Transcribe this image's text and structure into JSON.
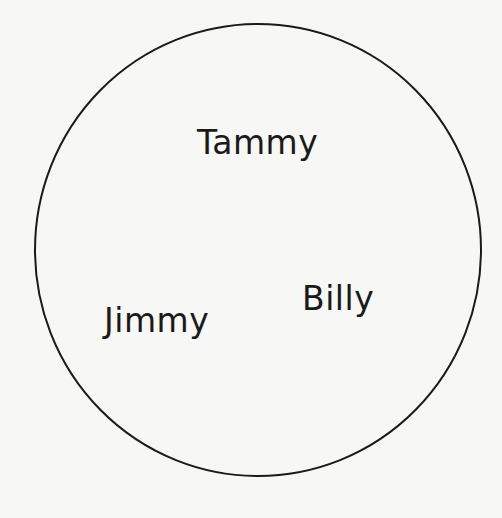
{
  "diagram": {
    "type": "venn-single-set",
    "background_color": "#f7f7f6",
    "stroke_color": "#1a1a1a",
    "circle": {
      "cx": 258,
      "cy": 250,
      "rx": 223,
      "ry": 226
    },
    "labels": [
      {
        "text": "Tammy",
        "x": 197,
        "y": 126
      },
      {
        "text": "Jimmy",
        "x": 104,
        "y": 304
      },
      {
        "text": "Billy",
        "x": 302,
        "y": 282
      }
    ]
  }
}
